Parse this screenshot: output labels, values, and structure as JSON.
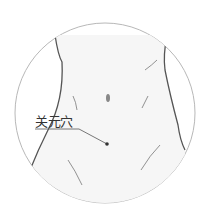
{
  "illustration": {
    "subject": "abdomen-acupoint",
    "acupoint_label": "关元穴",
    "colors": {
      "circle_stroke": "#b8b8b8",
      "body_outline": "#555555",
      "body_fill": "#f6f6f6",
      "dot": "#333333",
      "leader_line": "#555555"
    }
  }
}
